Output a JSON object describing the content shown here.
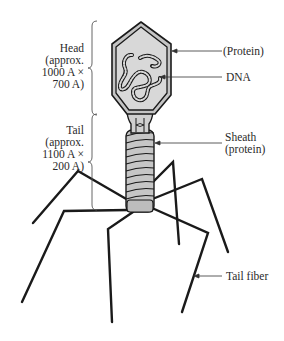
{
  "diagram": {
    "labels": {
      "head": {
        "lines": [
          "Head",
          "(approx.",
          "1000 A ×",
          "700 A)"
        ]
      },
      "tail": {
        "lines": [
          "Tail",
          "(approx.",
          "1100 A ×",
          "200 A)"
        ]
      },
      "protein": "(Protein)",
      "dna": "DNA",
      "sheath": {
        "lines": [
          "Sheath",
          "(protein)"
        ]
      },
      "tail_fiber": "Tail fiber"
    },
    "colors": {
      "stroke": "#1a1a1a",
      "fill": "#c8c8c8",
      "inner_fill": "#d6d6d6",
      "text": "#2a2a2a"
    }
  }
}
